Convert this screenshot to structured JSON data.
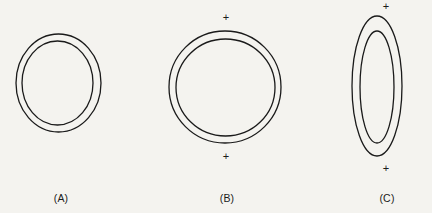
{
  "figure": {
    "background_color": "#f4f3ef",
    "stroke_color": "#1a1a1a",
    "width": 432,
    "height": 213,
    "panels": [
      {
        "id": "panel-a",
        "label": "(A)",
        "label_x": 61,
        "label_y": 199,
        "shape": "concentric-circles",
        "outer": {
          "cx": 58.5,
          "cy": 83.0,
          "rx": 42.5,
          "ry": 49.0,
          "stroke_width": 1.3
        },
        "inner": {
          "cx": 57.5,
          "cy": 83.0,
          "rx": 35.5,
          "ry": 42.0,
          "stroke_width": 1.3
        },
        "plus_marks": []
      },
      {
        "id": "panel-b",
        "label": "(B)",
        "label_x": 227,
        "label_y": 199,
        "shape": "concentric-circles",
        "outer": {
          "cx": 225.0,
          "cy": 87.0,
          "rx": 56.0,
          "ry": 56.0,
          "stroke_width": 1.3
        },
        "inner": {
          "cx": 225.5,
          "cy": 87.5,
          "rx": 49.5,
          "ry": 48.5,
          "stroke_width": 1.3
        },
        "plus_marks": [
          {
            "id": "plus-b-top",
            "x": 226,
            "y": 17,
            "glyph": "+"
          },
          {
            "id": "plus-b-bottom",
            "x": 226,
            "y": 156,
            "glyph": "+"
          }
        ]
      },
      {
        "id": "panel-c",
        "label": "(C)",
        "label_x": 387,
        "label_y": 199,
        "shape": "concentric-ellipses",
        "outer": {
          "cx": 377.0,
          "cy": 86.0,
          "rx": 25.0,
          "ry": 70.0,
          "stroke_width": 1.3
        },
        "inner": {
          "cx": 377.0,
          "cy": 87.0,
          "rx": 17.0,
          "ry": 56.0,
          "stroke_width": 1.3
        },
        "plus_marks": [
          {
            "id": "plus-c-top",
            "x": 386,
            "y": 6,
            "glyph": "+"
          },
          {
            "id": "plus-c-bottom",
            "x": 386,
            "y": 168,
            "glyph": "+"
          }
        ]
      }
    ]
  },
  "chart_data": {
    "type": "diagram",
    "title": "",
    "subtitle": "",
    "panels": [
      {
        "label": "(A)",
        "outline": "circle",
        "outer_width_px": 85,
        "outer_height_px": 98,
        "inner_width_px": 71,
        "inner_height_px": 84,
        "ring_thickness_px": 7,
        "aspect_ratio": 0.87,
        "markers": 0
      },
      {
        "label": "(B)",
        "outline": "circle",
        "outer_width_px": 112,
        "outer_height_px": 112,
        "inner_width_px": 99,
        "inner_height_px": 97,
        "ring_thickness_px": 7,
        "aspect_ratio": 1.0,
        "markers": 2
      },
      {
        "label": "(C)",
        "outline": "ellipse",
        "outer_width_px": 50,
        "outer_height_px": 140,
        "inner_width_px": 34,
        "inner_height_px": 112,
        "ring_thickness_px": 8,
        "aspect_ratio": 0.36,
        "markers": 2
      }
    ],
    "marker_glyph": "+",
    "xlabel": "",
    "ylabel": "",
    "grid": false,
    "legend": false
  }
}
